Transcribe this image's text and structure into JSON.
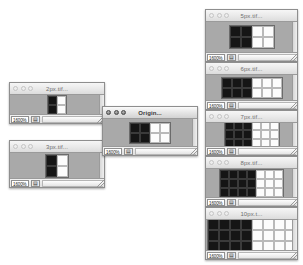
{
  "app": {
    "platform_style": "mac-os-classic-aqua",
    "zoom_level_label": "1600%",
    "size_widget_glyph": "▤"
  },
  "colors": {
    "window_canvas": "#a9a9a9",
    "titlebar_light": "#fbfbfb",
    "titlebar_dark": "#d2d2d2",
    "pixel_black": "#151515",
    "pixel_white": "#fcfcfc",
    "window_border": "#8e8e8e"
  },
  "windows": [
    {
      "id": "win-2px",
      "title": "2px.tif...",
      "active": false,
      "x": 9,
      "y": 82,
      "w": 96,
      "h": 42,
      "zoom": "1600%",
      "size_glyph": "▤",
      "artwork": {
        "cols": 1,
        "rows": 2,
        "cell": 9,
        "black_cols": 1,
        "white_cols": 1
      }
    },
    {
      "id": "win-3px",
      "title": "3px.tif...",
      "active": false,
      "x": 9,
      "y": 140,
      "w": 96,
      "h": 48,
      "zoom": "1600%",
      "size_glyph": "▤",
      "artwork": {
        "cols": 1,
        "rows": 2,
        "cell": 11,
        "black_cols": 1,
        "white_cols": 1
      }
    },
    {
      "id": "win-origin",
      "title": "Origin...",
      "active": true,
      "x": 102,
      "y": 106,
      "w": 96,
      "h": 50,
      "zoom": "1600%",
      "size_glyph": "▤",
      "artwork": {
        "cols": 2,
        "rows": 2,
        "cell": 10,
        "black_cols": 2,
        "white_cols": 2
      }
    },
    {
      "id": "win-5px",
      "title": "5px.tif...",
      "active": false,
      "x": 205,
      "y": 9,
      "w": 93,
      "h": 53,
      "zoom": "1600%",
      "size_glyph": "▤",
      "artwork": {
        "cols": 2,
        "rows": 2,
        "cell": 11,
        "black_cols": 2,
        "white_cols": 2
      }
    },
    {
      "id": "win-6px",
      "title": "6px.tif...",
      "active": false,
      "x": 205,
      "y": 62,
      "w": 93,
      "h": 48,
      "zoom": "1600%",
      "size_glyph": "▤",
      "artwork": {
        "cols": 3,
        "rows": 2,
        "cell": 10,
        "black_cols": 3,
        "white_cols": 3
      }
    },
    {
      "id": "win-7px",
      "title": "7px.tif...",
      "active": false,
      "x": 205,
      "y": 110,
      "w": 93,
      "h": 46,
      "zoom": "1600%",
      "size_glyph": "▤",
      "artwork": {
        "cols": 3,
        "rows": 3,
        "cell": 9,
        "black_cols": 3,
        "white_cols": 3
      }
    },
    {
      "id": "win-8px",
      "title": "8px.tif...",
      "active": false,
      "x": 205,
      "y": 156,
      "w": 93,
      "h": 51,
      "zoom": "1600%",
      "size_glyph": "▤",
      "artwork": {
        "cols": 4,
        "rows": 3,
        "cell": 9,
        "black_cols": 4,
        "white_cols": 3
      }
    },
    {
      "id": "win-10px",
      "title": "10px.t...",
      "active": false,
      "x": 205,
      "y": 207,
      "w": 93,
      "h": 53,
      "zoom": "1600%",
      "size_glyph": "▤",
      "artwork": {
        "cols": 4,
        "rows": 3,
        "cell": 11,
        "black_cols": 4,
        "white_cols": 4
      }
    }
  ]
}
